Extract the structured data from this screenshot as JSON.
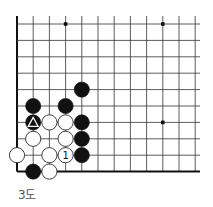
{
  "diagram": {
    "caption": "3도",
    "grid": {
      "origin_x": 17,
      "origin_y": 24,
      "step_x": 16.2,
      "step_y": 16.4,
      "cols": 12,
      "rows": 10,
      "right_extent": 200,
      "left_edge_is_board_edge": true,
      "bottom_edge_is_board_edge": true,
      "line_color": "#333333",
      "edge_color": "#111111"
    },
    "star_points": [
      {
        "col": 3,
        "row": 0
      },
      {
        "col": 9,
        "row": 0
      },
      {
        "col": 9,
        "row": 6
      }
    ],
    "stones": [
      {
        "color": "black",
        "col": 4,
        "row": 4
      },
      {
        "color": "black",
        "col": 1,
        "row": 5
      },
      {
        "color": "black",
        "col": 3,
        "row": 5
      },
      {
        "color": "black",
        "col": 1,
        "row": 6,
        "mark": "triangle"
      },
      {
        "color": "white",
        "col": 2,
        "row": 6
      },
      {
        "color": "white",
        "col": 3,
        "row": 6
      },
      {
        "color": "black",
        "col": 4,
        "row": 6
      },
      {
        "color": "white",
        "col": 1,
        "row": 7
      },
      {
        "color": "white",
        "col": 3,
        "row": 7
      },
      {
        "color": "black",
        "col": 4,
        "row": 7
      },
      {
        "color": "white",
        "col": 0,
        "row": 8
      },
      {
        "color": "white",
        "col": 2,
        "row": 8
      },
      {
        "color": "white",
        "col": 3,
        "row": 8,
        "label": "1"
      },
      {
        "color": "black",
        "col": 4,
        "row": 8
      },
      {
        "color": "black",
        "col": 1,
        "row": 9
      },
      {
        "color": "white",
        "col": 2,
        "row": 9
      }
    ]
  }
}
